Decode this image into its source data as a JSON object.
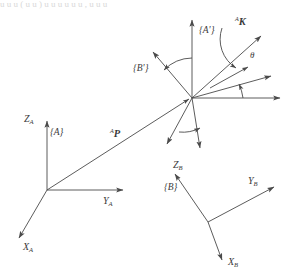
{
  "figure": {
    "title_cropped": "u u u   ( u u )   u u  u u u u ,  u u u",
    "background_color": "#ffffff",
    "line_color": "#4a4a4a",
    "label_color": "#3a3a3a"
  },
  "frames": {
    "A": {
      "name": "{A}",
      "origin": {
        "x": 47,
        "y": 190
      },
      "axes": [
        {
          "name": "Z_A",
          "label_base": "Z",
          "label_sub": "A",
          "tip": {
            "x": 47,
            "y": 118
          },
          "label_pos": {
            "x": 27,
            "y": 122
          }
        },
        {
          "name": "Y_A",
          "label_base": "Y",
          "label_sub": "A",
          "tip": {
            "x": 126,
            "y": 190
          },
          "label_pos": {
            "x": 104,
            "y": 203
          }
        },
        {
          "name": "X_A",
          "label_base": "X",
          "label_sub": "A",
          "tip": {
            "x": 16,
            "y": 240
          },
          "label_pos": {
            "x": 24,
            "y": 247
          }
        }
      ],
      "frame_label_pos": {
        "x": 52,
        "y": 133
      }
    },
    "B": {
      "name": "{B}",
      "origin": {
        "x": 208,
        "y": 222
      },
      "axes": [
        {
          "name": "Z_B",
          "label_base": "Z",
          "label_sub": "B",
          "tip": {
            "x": 172,
            "y": 171
          },
          "label_pos": {
            "x": 174,
            "y": 165
          }
        },
        {
          "name": "Y_B",
          "label_base": "Y",
          "label_sub": "B",
          "tip": {
            "x": 278,
            "y": 185
          },
          "label_pos": {
            "x": 249,
            "y": 182
          }
        },
        {
          "name": "X_B",
          "label_base": "X",
          "label_sub": "B",
          "tip": {
            "x": 224,
            "y": 264
          },
          "label_pos": {
            "x": 228,
            "y": 263
          }
        }
      ],
      "frame_label_pos": {
        "x": 166,
        "y": 187
      }
    },
    "A_prime": {
      "name": "{A'}",
      "label_pos": {
        "x": 200,
        "y": 30
      }
    },
    "B_prime": {
      "name": "{B'}",
      "label_pos": {
        "x": 136,
        "y": 68
      }
    }
  },
  "vectors": {
    "P": {
      "superscript": "A",
      "name": "P",
      "from": {
        "x": 47,
        "y": 190
      },
      "to": {
        "x": 190,
        "y": 98
      },
      "label_pos": {
        "x": 113,
        "y": 134
      }
    },
    "K": {
      "superscript": "A",
      "name": "K",
      "from": {
        "x": 192,
        "y": 98
      },
      "to": {
        "x": 264,
        "y": 33
      },
      "label_pos": {
        "x": 238,
        "y": 22
      }
    }
  },
  "angles": {
    "theta": {
      "symbol": "θ",
      "label_pos": {
        "x": 253,
        "y": 55
      }
    }
  },
  "hub": {
    "name": "common-origin",
    "x": 192,
    "y": 98,
    "arrows": [
      {
        "id": "a-prime-z",
        "to": {
          "x": 192,
          "y": 17
        }
      },
      {
        "id": "b-prime-z",
        "to": {
          "x": 150,
          "y": 49
        }
      },
      {
        "id": "a-prime-y",
        "to": {
          "x": 283,
          "y": 98
        }
      },
      {
        "id": "b-prime-y",
        "to": {
          "x": 275,
          "y": 73
        }
      },
      {
        "id": "a-prime-x",
        "to": {
          "x": 201,
          "y": 152
        }
      },
      {
        "id": "b-prime-x",
        "to": {
          "x": 165,
          "y": 148
        }
      }
    ]
  }
}
